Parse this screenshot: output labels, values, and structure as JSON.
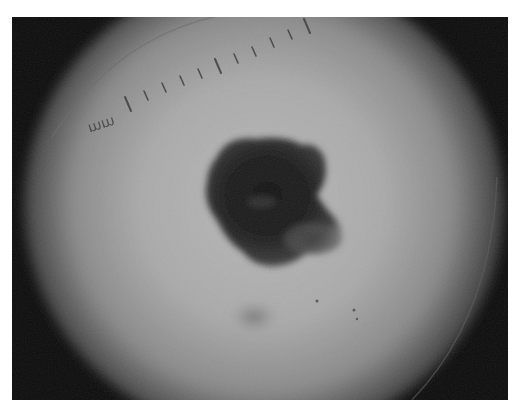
{
  "image": {
    "description": "Grayscale dermoscopy photograph of a pigmented skin lesion",
    "scale_label": "mm",
    "colors": {
      "background": "#ffffff",
      "vignette": "#0c0c0c",
      "skin_center": "#b4b4b4",
      "skin_mid": "#9a9a9a",
      "lesion_core": "#1a1a1a",
      "lesion_edge": "#4a4a4a",
      "ruler_tick": "#3a3a3a"
    }
  }
}
